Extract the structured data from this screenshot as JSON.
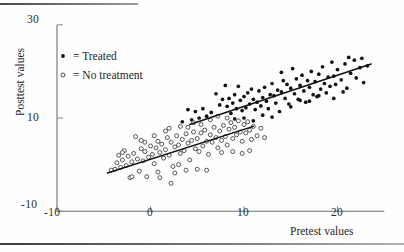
{
  "figure": {
    "background_color": "#fefefe",
    "ink_color": "#131313"
  },
  "legend": {
    "items": [
      {
        "marker": "filled-dot",
        "label": "= Treated"
      },
      {
        "marker": "open-circle",
        "label": "= No treatment"
      }
    ]
  },
  "chart_data": {
    "type": "scatter",
    "title": "",
    "xlabel": "Pretest values",
    "ylabel": "Posttest values",
    "xlim": [
      -10,
      25
    ],
    "ylim": [
      -10,
      30
    ],
    "xticks": [
      -10,
      0,
      10,
      20
    ],
    "xtick_labels": [
      "-10",
      "0",
      "10",
      "20"
    ],
    "yticks": [
      -10,
      10,
      30
    ],
    "ytick_labels": [
      "-10",
      "10",
      "30"
    ],
    "grid": false,
    "legend_position": "upper-left-inside",
    "series": [
      {
        "name": "Treated",
        "marker": "filled-dot",
        "color": "#131313",
        "points": [
          [
            7.0,
            15.2
          ],
          [
            7.4,
            12.8
          ],
          [
            7.7,
            14.0
          ],
          [
            8.0,
            17.0
          ],
          [
            8.2,
            12.5
          ],
          [
            8.4,
            14.2
          ],
          [
            8.6,
            11.0
          ],
          [
            8.8,
            13.2
          ],
          [
            9.0,
            15.0
          ],
          [
            9.2,
            12.0
          ],
          [
            9.4,
            16.8
          ],
          [
            9.6,
            13.8
          ],
          [
            9.8,
            11.6
          ],
          [
            10.0,
            14.6
          ],
          [
            10.2,
            12.2
          ],
          [
            10.4,
            15.4
          ],
          [
            10.6,
            13.0
          ],
          [
            10.8,
            16.2
          ],
          [
            11.0,
            14.0
          ],
          [
            11.2,
            11.8
          ],
          [
            11.4,
            13.4
          ],
          [
            11.6,
            15.8
          ],
          [
            11.8,
            12.6
          ],
          [
            12.0,
            14.4
          ],
          [
            12.2,
            16.6
          ],
          [
            12.4,
            13.6
          ],
          [
            12.6,
            12.0
          ],
          [
            12.8,
            15.0
          ],
          [
            13.0,
            17.4
          ],
          [
            13.2,
            14.8
          ],
          [
            13.4,
            13.2
          ],
          [
            13.6,
            16.0
          ],
          [
            13.8,
            11.4
          ],
          [
            14.0,
            15.6
          ],
          [
            14.2,
            18.0
          ],
          [
            14.4,
            14.2
          ],
          [
            14.6,
            17.2
          ],
          [
            14.8,
            13.0
          ],
          [
            15.0,
            16.4
          ],
          [
            15.2,
            20.6
          ],
          [
            15.4,
            15.2
          ],
          [
            15.6,
            18.4
          ],
          [
            15.8,
            14.0
          ],
          [
            16.0,
            17.0
          ],
          [
            16.2,
            19.2
          ],
          [
            16.4,
            15.8
          ],
          [
            16.6,
            13.4
          ],
          [
            16.8,
            18.0
          ],
          [
            17.0,
            16.6
          ],
          [
            17.2,
            20.0
          ],
          [
            17.4,
            15.0
          ],
          [
            17.6,
            17.8
          ],
          [
            17.8,
            14.6
          ],
          [
            18.0,
            19.4
          ],
          [
            18.2,
            16.2
          ],
          [
            18.4,
            21.0
          ],
          [
            18.6,
            17.4
          ],
          [
            18.8,
            15.4
          ],
          [
            19.0,
            18.8
          ],
          [
            19.2,
            16.8
          ],
          [
            19.4,
            22.0
          ],
          [
            19.6,
            19.0
          ],
          [
            19.8,
            17.2
          ],
          [
            20.0,
            20.4
          ],
          [
            20.4,
            18.2
          ],
          [
            20.8,
            21.6
          ],
          [
            21.0,
            16.4
          ],
          [
            21.4,
            19.6
          ],
          [
            21.8,
            22.4
          ],
          [
            22.0,
            18.6
          ],
          [
            22.4,
            20.8
          ],
          [
            22.8,
            17.6
          ],
          [
            23.2,
            21.2
          ],
          [
            6.5,
            11.2
          ],
          [
            6.0,
            10.4
          ],
          [
            5.6,
            12.0
          ],
          [
            5.2,
            10.0
          ],
          [
            4.8,
            11.4
          ],
          [
            4.4,
            9.6
          ],
          [
            12.0,
            10.6
          ],
          [
            13.0,
            10.2
          ],
          [
            14.0,
            19.8
          ],
          [
            15.0,
            12.4
          ],
          [
            16.0,
            13.8
          ],
          [
            9.0,
            9.8
          ],
          [
            10.0,
            10.0
          ],
          [
            11.0,
            9.4
          ],
          [
            17.0,
            13.6
          ],
          [
            18.0,
            14.8
          ],
          [
            19.6,
            14.2
          ],
          [
            20.6,
            15.6
          ],
          [
            21.2,
            23.0
          ],
          [
            22.6,
            22.8
          ],
          [
            4.0,
            11.8
          ],
          [
            3.4,
            9.2
          ]
        ]
      },
      {
        "name": "No treatment",
        "marker": "open-circle",
        "color": "#3a3a3a",
        "points": [
          [
            -4.2,
            -1.2
          ],
          [
            -3.8,
            -1.0
          ],
          [
            -3.6,
            0.4
          ],
          [
            -3.4,
            2.0
          ],
          [
            -3.2,
            -0.6
          ],
          [
            -3.0,
            1.0
          ],
          [
            -2.8,
            3.0
          ],
          [
            -2.6,
            -0.2
          ],
          [
            -2.4,
            1.8
          ],
          [
            -2.2,
            -2.8
          ],
          [
            -2.0,
            0.6
          ],
          [
            -1.8,
            2.4
          ],
          [
            -1.6,
            6.0
          ],
          [
            -1.4,
            1.2
          ],
          [
            -1.2,
            -1.4
          ],
          [
            -1.0,
            3.4
          ],
          [
            -0.8,
            0.8
          ],
          [
            -0.6,
            2.8
          ],
          [
            -0.4,
            -2.6
          ],
          [
            -0.2,
            1.6
          ],
          [
            0.0,
            4.0
          ],
          [
            0.2,
            2.2
          ],
          [
            0.4,
            0.2
          ],
          [
            0.6,
            3.6
          ],
          [
            0.8,
            5.0
          ],
          [
            1.0,
            2.6
          ],
          [
            1.2,
            4.4
          ],
          [
            1.4,
            1.4
          ],
          [
            1.6,
            3.2
          ],
          [
            1.8,
            5.8
          ],
          [
            2.0,
            2.0
          ],
          [
            2.2,
            4.8
          ],
          [
            2.4,
            -0.4
          ],
          [
            2.6,
            3.8
          ],
          [
            2.8,
            6.2
          ],
          [
            3.0,
            4.2
          ],
          [
            3.2,
            2.4
          ],
          [
            3.4,
            5.4
          ],
          [
            3.6,
            3.0
          ],
          [
            3.8,
            6.6
          ],
          [
            4.0,
            4.6
          ],
          [
            4.2,
            1.0
          ],
          [
            4.4,
            5.2
          ],
          [
            4.6,
            7.0
          ],
          [
            4.8,
            3.4
          ],
          [
            5.0,
            5.6
          ],
          [
            5.2,
            2.8
          ],
          [
            5.4,
            6.8
          ],
          [
            5.6,
            4.0
          ],
          [
            5.8,
            7.4
          ],
          [
            6.0,
            5.0
          ],
          [
            6.2,
            2.2
          ],
          [
            6.4,
            6.4
          ],
          [
            6.6,
            4.8
          ],
          [
            6.8,
            8.0
          ],
          [
            7.0,
            5.8
          ],
          [
            7.2,
            3.6
          ],
          [
            7.4,
            7.2
          ],
          [
            7.6,
            5.2
          ],
          [
            7.8,
            8.4
          ],
          [
            8.0,
            6.0
          ],
          [
            8.2,
            4.2
          ],
          [
            8.4,
            7.6
          ],
          [
            8.6,
            9.0
          ],
          [
            8.8,
            5.6
          ],
          [
            9.0,
            8.0
          ],
          [
            9.2,
            6.4
          ],
          [
            9.4,
            9.4
          ],
          [
            9.6,
            7.0
          ],
          [
            9.8,
            5.0
          ],
          [
            10.0,
            8.6
          ],
          [
            10.2,
            6.8
          ],
          [
            10.4,
            9.2
          ],
          [
            10.6,
            7.4
          ],
          [
            10.8,
            5.4
          ],
          [
            11.0,
            8.2
          ],
          [
            11.4,
            6.2
          ],
          [
            11.8,
            7.8
          ],
          [
            12.2,
            5.8
          ],
          [
            2.2,
            -4.0
          ],
          [
            1.0,
            -2.8
          ],
          [
            -2.0,
            -2.6
          ],
          [
            3.0,
            0.0
          ],
          [
            5.0,
            -1.0
          ],
          [
            6.0,
            -1.2
          ],
          [
            7.6,
            2.6
          ],
          [
            0.4,
            6.2
          ],
          [
            1.6,
            7.2
          ],
          [
            3.2,
            8.2
          ],
          [
            4.0,
            8.0
          ],
          [
            5.4,
            8.6
          ],
          [
            6.4,
            9.6
          ],
          [
            7.2,
            10.4
          ],
          [
            8.2,
            10.0
          ],
          [
            -0.6,
            4.8
          ],
          [
            2.0,
            7.8
          ],
          [
            4.6,
            9.0
          ],
          [
            8.8,
            2.8
          ],
          [
            9.8,
            2.4
          ],
          [
            10.6,
            3.0
          ],
          [
            2.6,
            -1.8
          ],
          [
            -3.0,
            2.6
          ],
          [
            -1.0,
            5.2
          ],
          [
            0.8,
            -1.6
          ],
          [
            3.8,
            -1.2
          ]
        ]
      }
    ],
    "fit_lines": [
      {
        "name": "treated-regression",
        "x_start": 4.2,
        "y_start": 8.6,
        "x_end": 23.6,
        "y_end": 21.6
      },
      {
        "name": "control-regression",
        "x_start": -4.6,
        "y_start": -1.8,
        "x_end": 11.0,
        "y_end": 8.2
      }
    ]
  }
}
